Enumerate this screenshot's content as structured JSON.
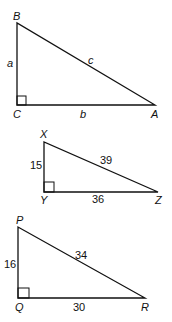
{
  "diagram": {
    "type": "right-triangles",
    "stroke_color": "#111111",
    "background": "#ffffff",
    "triangles": [
      {
        "name": "ABC",
        "vertices": {
          "top": "B",
          "right_angle": "C",
          "far": "A"
        },
        "sides": {
          "vertical": "a",
          "horizontal": "b",
          "hypotenuse": "c"
        },
        "italic_side_labels": true
      },
      {
        "name": "XYZ",
        "vertices": {
          "top": "X",
          "right_angle": "Y",
          "far": "Z"
        },
        "sides": {
          "vertical": "15",
          "horizontal": "36",
          "hypotenuse": "39"
        },
        "italic_side_labels": false
      },
      {
        "name": "PQR",
        "vertices": {
          "top": "P",
          "right_angle": "Q",
          "far": "R"
        },
        "sides": {
          "vertical": "16",
          "horizontal": "30",
          "hypotenuse": "34"
        },
        "italic_side_labels": false
      }
    ]
  }
}
